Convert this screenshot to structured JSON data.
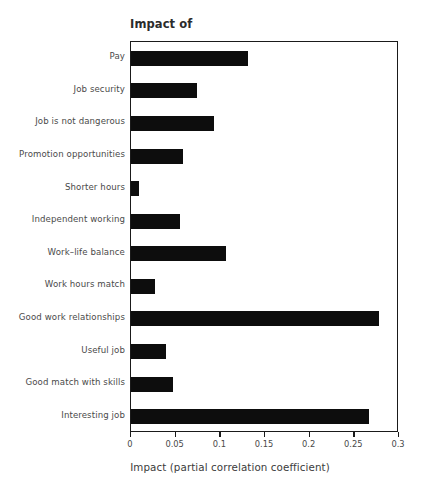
{
  "chart_data": {
    "type": "bar",
    "orientation": "horizontal",
    "title": "Impact of",
    "xlabel": "Impact (partial correlation coefficient)",
    "ylabel": "",
    "xlim": [
      0,
      0.3
    ],
    "xticks": [
      "0",
      "0.05",
      "0.1",
      "0.15",
      "0.2",
      "0.25",
      "0.3"
    ],
    "xtick_values": [
      0,
      0.05,
      0.1,
      0.15,
      0.2,
      0.25,
      0.3
    ],
    "grid": false,
    "legend": false,
    "bar_color": "#0d0d0d",
    "categories": [
      "Pay",
      "Job security",
      "Job is not dangerous",
      "Promotion opportunities",
      "Shorter hours",
      "Independent working",
      "Work–life balance",
      "Work hours match",
      "Good work relationships",
      "Useful job",
      "Good match with skills",
      "Interesting job"
    ],
    "values": [
      0.131,
      0.074,
      0.093,
      0.058,
      0.009,
      0.055,
      0.106,
      0.027,
      0.278,
      0.039,
      0.047,
      0.266
    ]
  }
}
